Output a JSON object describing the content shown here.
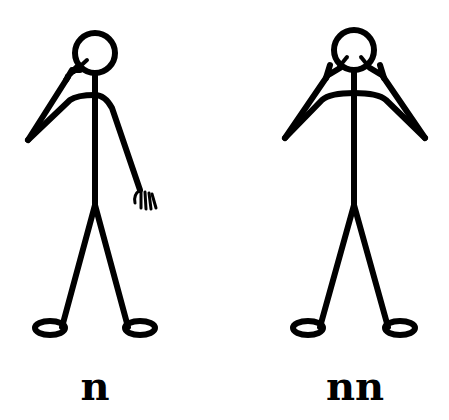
{
  "figures": [
    {
      "id": "left",
      "label": "n",
      "gesture": "one hand pointing at eye, other arm down with open hand"
    },
    {
      "id": "right",
      "label": "nn",
      "gesture": "both hands pointing at eyes"
    }
  ],
  "colors": {
    "stroke": "#000000",
    "background": "#ffffff"
  }
}
